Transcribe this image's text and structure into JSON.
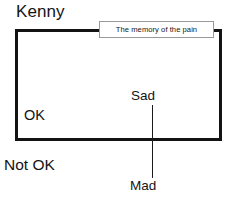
{
  "canvas": {
    "width": 232,
    "height": 209,
    "background": "#ffffff"
  },
  "diagram": {
    "title": "Kenny",
    "zone": {
      "inside_label": "OK",
      "outside_label": "Not OK",
      "border_color": "#131313"
    },
    "callout": {
      "text": "The memory of the pain",
      "border_color": "#9a9a9a",
      "fill_color": "#ffffff"
    },
    "axis": {
      "top_label": "Sad",
      "bottom_label": "Mad",
      "line_color": "#1b1b1b"
    }
  }
}
